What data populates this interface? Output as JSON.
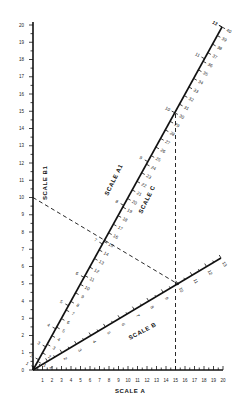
{
  "diagram": {
    "type": "nomogram",
    "scales": {
      "b1": {
        "title": "SCALE B1",
        "min": 0,
        "max": 20,
        "labels": [
          "0",
          "1",
          "2",
          "3",
          "4",
          "5",
          "6",
          "7",
          "8",
          "9",
          "10",
          "11",
          "12",
          "13",
          "14",
          "15",
          "16",
          "17",
          "18",
          "19",
          "20"
        ]
      },
      "a": {
        "title": "SCALE A",
        "min": 0,
        "max": 20,
        "labels": [
          "1",
          "2",
          "3",
          "4",
          "5",
          "6",
          "7",
          "8",
          "9",
          "10",
          "11",
          "12",
          "13",
          "14",
          "15",
          "16",
          "17",
          "18",
          "19",
          "20"
        ]
      },
      "a1": {
        "title": "SCALE A1",
        "min": 0,
        "max": 40,
        "labels": [
          "1",
          "2",
          "3",
          "4",
          "5",
          "6",
          "7",
          "8",
          "9",
          "10",
          "11",
          "12",
          "13",
          "14",
          "15",
          "16",
          "17",
          "18",
          "19",
          "20",
          "21",
          "22",
          "23",
          "24",
          "25",
          "26",
          "27",
          "28",
          "29",
          "30",
          "31",
          "32",
          "33",
          "34",
          "35",
          "36",
          "37",
          "38",
          "39",
          "40"
        ]
      },
      "c": {
        "title": "SCALE C",
        "min": 0,
        "max": 13,
        "labels": [
          "1",
          "2",
          "3",
          "4",
          "5",
          "6",
          "7",
          "8",
          "9",
          "10",
          "11",
          "12",
          "13"
        ]
      },
      "b": {
        "title": "SCALE B",
        "min": 0,
        "max": 13,
        "labels": [
          "1",
          "2",
          "3",
          "4",
          "5",
          "6",
          "7",
          "8",
          "9",
          "10",
          "11",
          "12",
          "13"
        ]
      }
    },
    "example": {
      "b1_value": 10,
      "a_value": 15,
      "b_value": 10,
      "a1_value": 30,
      "c_value": 10
    }
  }
}
